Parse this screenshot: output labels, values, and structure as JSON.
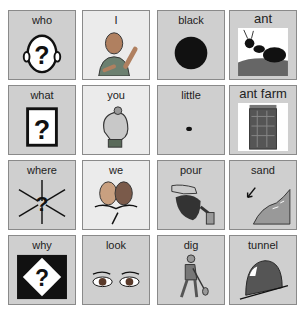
{
  "board": {
    "title": "Communication board",
    "cells": [
      {
        "label": "who",
        "icon": "question-head-icon"
      },
      {
        "label": "I",
        "icon": "person-self-icon"
      },
      {
        "label": "black",
        "icon": "black-circle-icon"
      },
      {
        "label": "ant",
        "icon": "ant-icon"
      },
      {
        "label": "what",
        "icon": "question-box-icon"
      },
      {
        "label": "you",
        "icon": "pointing-hand-icon"
      },
      {
        "label": "little",
        "icon": "small-dot-icon"
      },
      {
        "label": "ant farm",
        "icon": "ant-farm-icon"
      },
      {
        "label": "where",
        "icon": "question-arrows-icon"
      },
      {
        "label": "we",
        "icon": "two-faces-icon"
      },
      {
        "label": "pour",
        "icon": "watering-can-icon"
      },
      {
        "label": "sand",
        "icon": "sand-beach-icon"
      },
      {
        "label": "why",
        "icon": "question-diamond-icon"
      },
      {
        "label": "look",
        "icon": "eyes-icon"
      },
      {
        "label": "dig",
        "icon": "digging-person-icon"
      },
      {
        "label": "tunnel",
        "icon": "tunnel-icon"
      }
    ]
  },
  "colors": {
    "cell_gray": "#cfcfcf",
    "cell_light": "#ebebeb",
    "border": "#8a8a8a"
  }
}
